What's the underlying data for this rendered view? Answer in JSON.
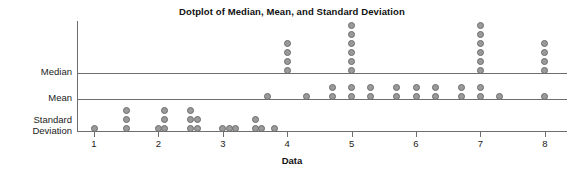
{
  "chart_data": {
    "type": "dotplot",
    "title": "Dotplot of Median, Mean, and Standard Deviation",
    "xlabel": "Data",
    "ylabel": "",
    "grid": false,
    "legend": null,
    "xlim": [
      0.6,
      8.4
    ],
    "xticks": [
      1,
      2,
      3,
      4,
      5,
      6,
      7,
      8
    ],
    "xticklabels": [
      "1",
      "2",
      "3",
      "4",
      "5",
      "6",
      "7",
      "8"
    ],
    "rows": [
      {
        "name": "median",
        "label": "Median",
        "points": [
          {
            "x": 4.0,
            "count": 4
          },
          {
            "x": 5.0,
            "count": 6
          },
          {
            "x": 7.0,
            "count": 6
          },
          {
            "x": 8.0,
            "count": 4
          }
        ]
      },
      {
        "name": "mean",
        "label": "Mean",
        "points": [
          {
            "x": 3.7,
            "count": 1
          },
          {
            "x": 4.3,
            "count": 1
          },
          {
            "x": 4.7,
            "count": 2
          },
          {
            "x": 5.0,
            "count": 2
          },
          {
            "x": 5.3,
            "count": 2
          },
          {
            "x": 5.7,
            "count": 2
          },
          {
            "x": 6.0,
            "count": 2
          },
          {
            "x": 6.3,
            "count": 2
          },
          {
            "x": 6.7,
            "count": 2
          },
          {
            "x": 7.0,
            "count": 2
          },
          {
            "x": 7.3,
            "count": 1
          },
          {
            "x": 8.0,
            "count": 1
          }
        ]
      },
      {
        "name": "standard-deviation",
        "label": "Standard\nDeviation",
        "points": [
          {
            "x": 1.0,
            "count": 1
          },
          {
            "x": 1.5,
            "count": 3
          },
          {
            "x": 2.0,
            "count": 1
          },
          {
            "x": 2.1,
            "count": 3
          },
          {
            "x": 2.5,
            "count": 3
          },
          {
            "x": 2.6,
            "count": 2
          },
          {
            "x": 3.0,
            "count": 1
          },
          {
            "x": 3.1,
            "count": 1
          },
          {
            "x": 3.2,
            "count": 1
          },
          {
            "x": 3.5,
            "count": 2
          },
          {
            "x": 3.6,
            "count": 1
          },
          {
            "x": 3.8,
            "count": 1
          }
        ]
      }
    ],
    "colors": {
      "dot_fill": "#9a9a9a",
      "dot_stroke": "#6b6b6b",
      "axis": "#6e6e6e",
      "text": "#1b1b1b",
      "background": "#ffffff"
    }
  }
}
